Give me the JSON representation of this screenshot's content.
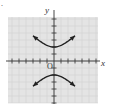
{
  "chart_data": {
    "type": "line",
    "title": "",
    "xlabel": "x",
    "ylabel": "y",
    "origin_label": "O",
    "xlim": [
      -6.5,
      6.5
    ],
    "ylim": [
      -6,
      6
    ],
    "grid": true,
    "tick_step": 1,
    "equation": "y^2/4 - x^2/4 = 1",
    "series": [
      {
        "name": "upper branch",
        "x": [
          -3,
          -2.5,
          -2,
          -1.5,
          -1,
          -0.5,
          0,
          0.5,
          1,
          1.5,
          2,
          2.5,
          3
        ],
        "y": [
          3.61,
          3.2,
          2.83,
          2.5,
          2.24,
          2.06,
          2.0,
          2.06,
          2.24,
          2.5,
          2.83,
          3.2,
          3.61
        ],
        "arrows": "both ends"
      },
      {
        "name": "lower branch",
        "x": [
          -3,
          -2.5,
          -2,
          -1.5,
          -1,
          -0.5,
          0,
          0.5,
          1,
          1.5,
          2,
          2.5,
          3
        ],
        "y": [
          -3.61,
          -3.2,
          -2.83,
          -2.5,
          -2.24,
          -2.06,
          -2.0,
          -2.06,
          -2.24,
          -2.5,
          -2.83,
          -3.2,
          -3.61
        ],
        "arrows": "both ends"
      }
    ],
    "vertices": [
      [
        0,
        2
      ],
      [
        0,
        -2
      ]
    ],
    "colors": {
      "grid_bg": "#e4e4e4",
      "grid_line": "#c8c8c8",
      "axis": "#333333",
      "curve": "#222222"
    }
  },
  "labels": {
    "x_axis": "x",
    "y_axis": "y",
    "origin": "O",
    "corner_mark": "."
  }
}
